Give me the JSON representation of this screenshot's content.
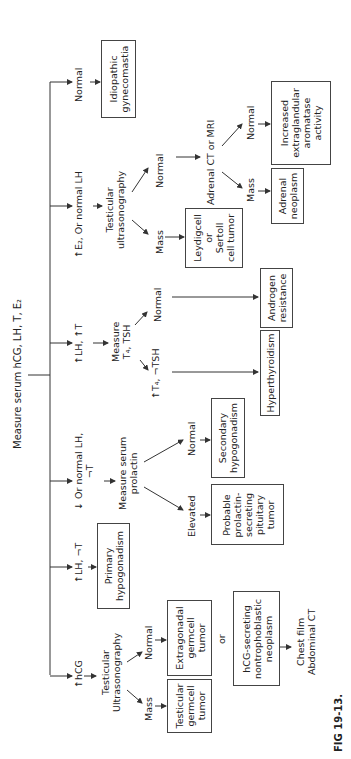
{
  "figure": {
    "caption": "FIG 19-13.",
    "orientation": "rotated 90° counter-clockwise",
    "root": "Measure serum hCG, LH, T, E₂"
  },
  "branches": [
    {
      "condition": "↑hCG",
      "test": "Testicular Ultrasonography",
      "outcomes": [
        {
          "label": "Mass",
          "result": "Testicular germcell tumor"
        },
        {
          "label": "Normal",
          "result": "Extragonadal germcell tumor"
        }
      ],
      "or": "or",
      "alt_result": "hCG-secreting nontrophoblastic neoplasm",
      "follow_up": "Chest film Abdominal CT"
    },
    {
      "condition": "↑LH, ¬T",
      "result": "Primary hypogonadism"
    },
    {
      "condition_line1": "↓ Or normal LH,",
      "condition_line2": "¬T",
      "test": "Measure serum prolactin",
      "outcomes": [
        {
          "label": "Elevated",
          "result": "Probable prolactin-secreting pituitary tumor"
        },
        {
          "label": "Normal",
          "result": "Secondary hypogonadism"
        }
      ]
    },
    {
      "condition": "↑LH, ↑T",
      "test": "Measure T₄, TSH",
      "outcomes": [
        {
          "label": "↑T₄, ¬TSH",
          "result": "Hyperthyroidism"
        },
        {
          "label": "Normal",
          "result": "Androgen resistance"
        }
      ]
    },
    {
      "condition": "↑E₂, Or normal LH",
      "test": "Testicular ultrasonography",
      "outcomes": [
        {
          "label": "Mass",
          "result": "Leydigcell or Sertoll cell tumor"
        },
        {
          "label": "Normal",
          "next_test": "Adrenal CT or MRI",
          "sub_outcomes": [
            {
              "label": "Mass",
              "result": "Adrenal neoplasm"
            },
            {
              "label": "Normal",
              "result": "Increased extraglandular aromatase activity"
            }
          ]
        }
      ]
    },
    {
      "condition": "Normal",
      "result": "Idiopathic gynecomastia"
    }
  ],
  "labels": {
    "root": "Measure serum hCG, LH, T, E₂",
    "b1_cond": "↑hCG",
    "b1_test_l1": "Testicular",
    "b1_test_l2": "Ultrasonography",
    "b1_mass": "Mass",
    "b1_normal": "Normal",
    "b1_mass_res_l1": "Testicular",
    "b1_mass_res_l2": "germcell",
    "b1_mass_res_l3": "tumor",
    "b1_norm_res_l1": "Extragonadal",
    "b1_norm_res_l2": "germcell",
    "b1_norm_res_l3": "tumor",
    "b1_or": "or",
    "b1_alt_l1": "hCG-secreting",
    "b1_alt_l2": "nontrophoblastic",
    "b1_alt_l3": "neoplasm",
    "b1_follow_l1": "Chest film",
    "b1_follow_l2": "Abdominal CT",
    "b2_cond": "↑LH, ¬T",
    "b2_res_l1": "Primary",
    "b2_res_l2": "hypogonadism",
    "b3_cond_l1": "↓ Or normal LH,",
    "b3_cond_l2": "¬T",
    "b3_test_l1": "Measure serum",
    "b3_test_l2": "prolactin",
    "b3_elev": "Elevated",
    "b3_normal": "Normal",
    "b3_elev_res_l1": "Probable",
    "b3_elev_res_l2": "prolactin-",
    "b3_elev_res_l3": "secreting",
    "b3_elev_res_l4": "pituitary",
    "b3_elev_res_l5": "tumor",
    "b3_norm_res_l1": "Secondary",
    "b3_norm_res_l2": "hypogonadism",
    "b4_cond": "↑LH, ↑T",
    "b4_test_l1": "Measure",
    "b4_test_l2": "T₄, TSH",
    "b4_thy": "↑T₄, ¬TSH",
    "b4_normal": "Normal",
    "b4_thy_res": "Hyperthyroidism",
    "b4_norm_res_l1": "Androgen",
    "b4_norm_res_l2": "resistance",
    "b5_cond": "↑E₂, Or normal LH",
    "b5_test_l1": "Testicular",
    "b5_test_l2": "ultrasonography",
    "b5_mass": "Mass",
    "b5_normal": "Normal",
    "b5_mass_res_l1": "Leydigcell",
    "b5_mass_res_l2": "or",
    "b5_mass_res_l3": "Sertoll",
    "b5_mass_res_l4": "cell tumor",
    "b5_adrenal": "Adrenal CT or MRI",
    "b5_ad_mass": "Mass",
    "b5_ad_normal": "Normal",
    "b5_ad_mass_res_l1": "Adrenal",
    "b5_ad_mass_res_l2": "neoplasm",
    "b5_ad_norm_res_l1": "Increased",
    "b5_ad_norm_res_l2": "extraglandular",
    "b5_ad_norm_res_l3": "aromatase",
    "b5_ad_norm_res_l4": "activity",
    "b6_cond": "Normal",
    "b6_res_l1": "Idiopathic",
    "b6_res_l2": "gynecomastia",
    "caption": "FIG 19-13."
  },
  "colors": {
    "line": "#333333",
    "text": "#222222",
    "background": "#ffffff"
  }
}
